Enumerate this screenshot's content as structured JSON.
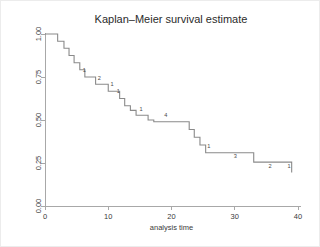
{
  "chart_data": {
    "type": "line",
    "title": "Kaplan–Meier survival estimate",
    "xlabel": "analysis time",
    "ylabel": "",
    "xlim": [
      0,
      40
    ],
    "ylim": [
      0,
      1
    ],
    "grid": false,
    "legend": "none",
    "xticks": [
      "0",
      "10",
      "20",
      "30",
      "40"
    ],
    "xtick_values": [
      0,
      10,
      20,
      30,
      40
    ],
    "yticks": [
      "0.00",
      "0.25",
      "0.50",
      "0.75",
      "1.00"
    ],
    "ytick_values": [
      0,
      0.25,
      0.5,
      0.75,
      1
    ],
    "ytick_rotation": 90,
    "step_style": "post",
    "series": [
      {
        "name": "survival",
        "x": [
          0.0,
          1.0,
          2.0,
          3.0,
          3.8,
          4.6,
          5.5,
          6.3,
          7.2,
          8.0,
          8.9,
          10.0,
          10.9,
          11.8,
          12.6,
          13.5,
          14.4,
          15.4,
          16.3,
          17.2,
          22.0,
          22.8,
          23.6,
          24.5,
          25.4,
          27.8,
          33.0,
          39.0
        ],
        "y": [
          1.0,
          1.0,
          0.958,
          0.917,
          0.875,
          0.833,
          0.792,
          0.75,
          0.75,
          0.708,
          0.708,
          0.667,
          0.667,
          0.625,
          0.583,
          0.556,
          0.528,
          0.528,
          0.5,
          0.49,
          0.49,
          0.445,
          0.4,
          0.355,
          0.31,
          0.31,
          0.255,
          0.195
        ]
      }
    ],
    "censor_annotations": [
      {
        "label": "1",
        "x": 6.2,
        "y": 0.78
      },
      {
        "label": "2",
        "x": 8.6,
        "y": 0.735
      },
      {
        "label": "1",
        "x": 10.6,
        "y": 0.695
      },
      {
        "label": "1",
        "x": 11.6,
        "y": 0.655
      },
      {
        "label": "1",
        "x": 15.2,
        "y": 0.555
      },
      {
        "label": "4",
        "x": 19.1,
        "y": 0.515
      },
      {
        "label": "1",
        "x": 25.9,
        "y": 0.335
      },
      {
        "label": "3",
        "x": 30.1,
        "y": 0.28
      },
      {
        "label": "2",
        "x": 35.6,
        "y": 0.22
      },
      {
        "label": "1",
        "x": 38.6,
        "y": 0.22
      }
    ],
    "colors": {
      "curve": "#8a8a8a",
      "axis": "#a8a8a8",
      "text": "#3a3a3a",
      "title": "#2b2b2b",
      "background": "#ffffff"
    }
  },
  "figure": {
    "plot_area": {
      "left": 44,
      "top": 33,
      "right": 297,
      "bottom": 205
    }
  }
}
